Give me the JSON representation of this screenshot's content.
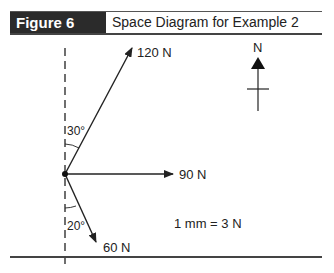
{
  "figure": {
    "label": "Figure 6",
    "title": "Space Diagram for Example 2"
  },
  "diagram": {
    "forces": [
      {
        "name": "force-120",
        "label": "120 N",
        "magnitude": 120,
        "unit": "N",
        "angle_label": "30°",
        "angle_from": "north",
        "direction": "east of north"
      },
      {
        "name": "force-90",
        "label": "90 N",
        "magnitude": 90,
        "unit": "N",
        "direction": "east"
      },
      {
        "name": "force-60",
        "label": "60 N",
        "magnitude": 60,
        "unit": "N",
        "angle_label": "20°",
        "angle_from": "south",
        "direction": "east of south"
      }
    ],
    "north_label": "N",
    "scale_label": "1 mm = 3 N"
  },
  "colors": {
    "header_bg": "#2b2b2b",
    "line": "#222222"
  }
}
